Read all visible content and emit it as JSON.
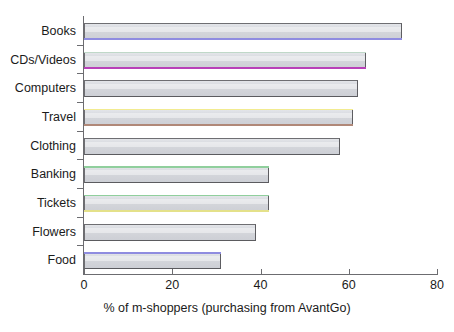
{
  "chart_data": {
    "type": "bar",
    "orientation": "horizontal",
    "title": "",
    "subtitle": "",
    "xlabel": "% of m-shoppers (purchasing from AvantGo)",
    "ylabel": "",
    "categories": [
      "Books",
      "CDs/Videos",
      "Computers",
      "Travel",
      "Clothing",
      "Banking",
      "Tickets",
      "Flowers",
      "Food"
    ],
    "values": [
      72,
      64,
      62,
      61,
      58,
      42,
      42,
      39,
      31
    ],
    "xlim": [
      0,
      80
    ],
    "xticks": [
      0,
      20,
      40,
      60,
      80
    ],
    "xtick_labels": [
      "0",
      "20",
      "40",
      "60",
      "80"
    ],
    "grid": false,
    "legend": "none",
    "bar_fill_color": "#d5d7dc",
    "bar_border_color": "#6e6e72",
    "background_color": "#ffffff",
    "axis_color": "#6c6c70",
    "accent_lines": [
      {
        "category": "Books",
        "position": "bottom",
        "color": "#8f8ce0"
      },
      {
        "category": "CDs/Videos",
        "position": "bottom",
        "color": "#b840b8"
      },
      {
        "category": "CDs/Videos",
        "position": "top",
        "color": "#bfd8c8"
      },
      {
        "category": "Travel",
        "position": "top",
        "color": "#f2eb90"
      },
      {
        "category": "Travel",
        "position": "bottom",
        "color": "#b08878"
      },
      {
        "category": "Banking",
        "position": "top",
        "color": "#90cf9d"
      },
      {
        "category": "Tickets",
        "position": "top",
        "color": "#90cf9d"
      },
      {
        "category": "Tickets",
        "position": "bottom",
        "color": "#e4e18a"
      },
      {
        "category": "Food",
        "position": "top",
        "color": "#8f8ce0"
      }
    ]
  },
  "axis": {
    "x_title": "% of m-shoppers (purchasing from AvantGo)"
  }
}
